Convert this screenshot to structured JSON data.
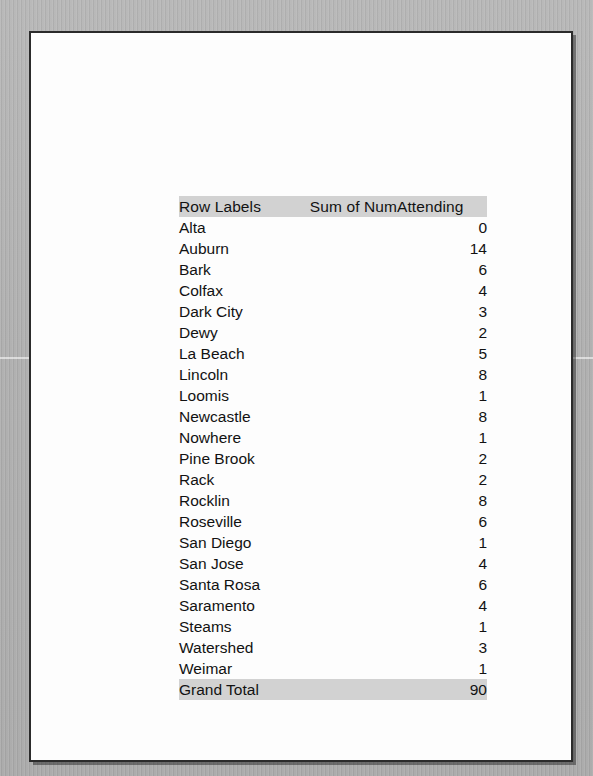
{
  "document": {
    "kind": "scanned-printout",
    "page_background": "#fdfdfd",
    "scan_background": "#b0b0b0"
  },
  "table": {
    "headers": {
      "row_labels": "Row Labels",
      "value": "Sum of NumAttending"
    },
    "header_fill": "#d2d2d2",
    "total_fill": "#d2d2d2",
    "rows": [
      {
        "label": "Alta",
        "value": "0"
      },
      {
        "label": "Auburn",
        "value": "14"
      },
      {
        "label": "Bark",
        "value": "6"
      },
      {
        "label": "Colfax",
        "value": "4"
      },
      {
        "label": "Dark City",
        "value": "3"
      },
      {
        "label": "Dewy",
        "value": "2"
      },
      {
        "label": "La Beach",
        "value": "5"
      },
      {
        "label": "Lincoln",
        "value": "8"
      },
      {
        "label": "Loomis",
        "value": "1"
      },
      {
        "label": "Newcastle",
        "value": "8"
      },
      {
        "label": "Nowhere",
        "value": "1"
      },
      {
        "label": "Pine Brook",
        "value": "2"
      },
      {
        "label": "Rack",
        "value": "2"
      },
      {
        "label": "Rocklin",
        "value": "8"
      },
      {
        "label": "Roseville",
        "value": "6"
      },
      {
        "label": "San Diego",
        "value": "1"
      },
      {
        "label": "San Jose",
        "value": "4"
      },
      {
        "label": "Santa Rosa",
        "value": "6"
      },
      {
        "label": "Saramento",
        "value": "4"
      },
      {
        "label": "Steams",
        "value": "1"
      },
      {
        "label": "Watershed",
        "value": "3"
      },
      {
        "label": "Weimar",
        "value": "1"
      }
    ],
    "grand_total": {
      "label": "Grand Total",
      "value": "90"
    }
  },
  "chart_data": {
    "type": "table",
    "columns": [
      "Row Labels",
      "Sum of NumAttending"
    ],
    "categories": [
      "Alta",
      "Auburn",
      "Bark",
      "Colfax",
      "Dark City",
      "Dewy",
      "La Beach",
      "Lincoln",
      "Loomis",
      "Newcastle",
      "Nowhere",
      "Pine Brook",
      "Rack",
      "Rocklin",
      "Roseville",
      "San Diego",
      "San Jose",
      "Santa Rosa",
      "Saramento",
      "Steams",
      "Watershed",
      "Weimar"
    ],
    "values": [
      0,
      14,
      6,
      4,
      3,
      2,
      5,
      8,
      1,
      8,
      1,
      2,
      2,
      8,
      6,
      1,
      4,
      6,
      4,
      1,
      3,
      1
    ],
    "total": 90,
    "xlabel": "Row Labels",
    "ylabel": "Sum of NumAttending"
  }
}
